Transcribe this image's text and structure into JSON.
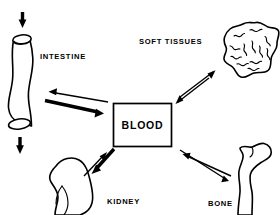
{
  "diagram": {
    "center_node": {
      "id": "blood",
      "label": "BLOOD",
      "shape": "rectangle"
    },
    "nodes": [
      {
        "id": "intestine",
        "label": "INTESTINE",
        "shape": "tube",
        "position": "left-top",
        "label_x": 40,
        "label_y": 59
      },
      {
        "id": "soft-tissues",
        "label": "SOFT  TISSUES",
        "shape": "irregular-blob",
        "position": "right-top",
        "label_x": 139,
        "label_y": 44
      },
      {
        "id": "kidney",
        "label": "KIDNEY",
        "shape": "bean",
        "position": "left-bottom",
        "label_x": 107,
        "label_y": 204
      },
      {
        "id": "bone",
        "label": "BONE",
        "shape": "long-bone",
        "position": "right-bottom",
        "label_x": 208,
        "label_y": 206
      }
    ],
    "connections": [
      {
        "from": "blood",
        "to": "intestine",
        "style": "thin",
        "direction": "to-intestine"
      },
      {
        "from": "intestine",
        "to": "blood",
        "style": "thick",
        "direction": "to-blood"
      },
      {
        "from": "blood",
        "to": "soft-tissues",
        "style": "thin",
        "direction": "to-soft-tissues"
      },
      {
        "from": "soft-tissues",
        "to": "blood",
        "style": "thin",
        "direction": "to-blood"
      },
      {
        "from": "kidney",
        "to": "blood",
        "style": "thin",
        "direction": "to-blood"
      },
      {
        "from": "blood",
        "to": "kidney",
        "style": "thick",
        "direction": "to-kidney"
      },
      {
        "from": "bone",
        "to": "blood",
        "style": "thin",
        "direction": "to-blood"
      },
      {
        "from": "blood",
        "to": "bone",
        "style": "thin",
        "direction": "to-bone"
      },
      {
        "from": "external",
        "to": "intestine",
        "style": "thick",
        "direction": "down-into-intestine"
      },
      {
        "from": "intestine",
        "to": "external",
        "style": "thick",
        "direction": "down-out-of-intestine"
      }
    ],
    "colors": {
      "stroke": "#000000",
      "background": "#ffffff"
    }
  }
}
